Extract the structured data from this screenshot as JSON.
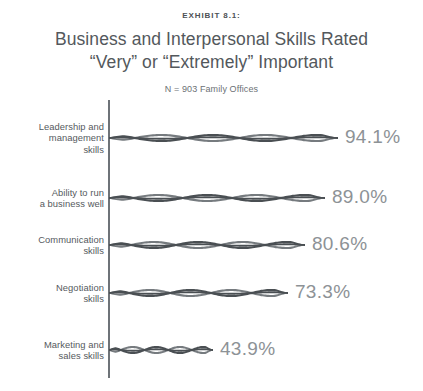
{
  "header": {
    "exhibit_label": "EXHIBIT 8.1:",
    "title_line1": "Business and Interpersonal Skills Rated",
    "title_line2": "“Very” or “Extremely” Important",
    "subtitle": "N = 903 Family Offices"
  },
  "colors": {
    "background": "#ffffff",
    "axis": "#6e7378",
    "bar_dark": "#4a4f53",
    "bar_mid": "#6f7478",
    "bar_light": "#c8cbcd",
    "category_text": "#555a5e",
    "value_text": "#8d9296",
    "title_text": "#53585c"
  },
  "chart_data": {
    "type": "bar",
    "orientation": "horizontal",
    "title": "Business and Interpersonal Skills Rated “Very” or “Extremely” Important",
    "subtitle": "N = 903 Family Offices",
    "xlabel": "",
    "ylabel": "",
    "xlim": [
      0,
      100
    ],
    "grid": false,
    "legend": false,
    "value_suffix": "%",
    "categories": [
      "Leadership and management skills",
      "Ability to run a business well",
      "Communication skills",
      "Negotiation skills",
      "Marketing and sales skills"
    ],
    "values": [
      94.1,
      89.0,
      80.6,
      73.3,
      43.9
    ],
    "value_labels": [
      "94.1%",
      "89.0%",
      "80.6%",
      "73.3%",
      "43.9%"
    ]
  },
  "bars": [
    {
      "label_lines": [
        "Leadership and",
        "management",
        "skills"
      ],
      "value_label": "94.1%",
      "value": 94.1,
      "top": 118,
      "center_y": 138,
      "bar_px": 229,
      "label_x": 345
    },
    {
      "label_lines": [
        "Ability to run",
        "a business well"
      ],
      "value_label": "89.0%",
      "value": 89.0,
      "top": 178,
      "center_y": 198,
      "bar_px": 216,
      "label_x": 332
    },
    {
      "label_lines": [
        "Communication",
        "skills"
      ],
      "value_label": "80.6%",
      "value": 80.6,
      "top": 225,
      "center_y": 245,
      "bar_px": 196,
      "label_x": 312
    },
    {
      "label_lines": [
        "Negotiation",
        "skills"
      ],
      "value_label": "73.3%",
      "value": 73.3,
      "top": 273,
      "center_y": 293,
      "bar_px": 179,
      "label_x": 295
    },
    {
      "label_lines": [
        "Marketing and",
        "sales skills"
      ],
      "value_label": "43.9%",
      "value": 43.9,
      "top": 330,
      "center_y": 350,
      "bar_px": 104,
      "label_x": 220
    }
  ]
}
